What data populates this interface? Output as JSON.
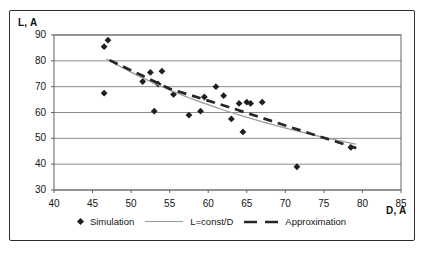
{
  "colors": {
    "background": "#ffffff",
    "frame_border": "#2e2e2e",
    "grid_line": "#8c8c8c",
    "axis_line": "#636363",
    "marker": "#1f1f1f",
    "const_line": "#9c9c9c",
    "approx_line": "#262626",
    "text": "#151515"
  },
  "axis_titles": {
    "y": "L, A",
    "x": "D, A"
  },
  "legend": {
    "items": [
      {
        "label": "Simulation",
        "marker": "diamond"
      },
      {
        "label": "L=const/D",
        "marker": "solid-line"
      },
      {
        "label": "Approximation",
        "marker": "dashed-line"
      }
    ]
  },
  "chart_data": {
    "type": "scatter",
    "title": "",
    "xlabel": "D, A",
    "ylabel": "L, A",
    "xlim": [
      40,
      85
    ],
    "ylim": [
      30,
      90
    ],
    "x_ticks": [
      40,
      45,
      50,
      55,
      60,
      65,
      70,
      75,
      80,
      85
    ],
    "y_ticks": [
      30,
      40,
      50,
      60,
      70,
      80,
      90
    ],
    "grid": "horizontal-only",
    "legend_position": "bottom",
    "series": [
      {
        "name": "Simulation",
        "type": "scatter",
        "marker": "diamond",
        "points": [
          [
            46.5,
            85.5
          ],
          [
            46.5,
            67.5
          ],
          [
            47,
            88
          ],
          [
            51.5,
            72
          ],
          [
            52.5,
            75.5
          ],
          [
            53,
            60.5
          ],
          [
            53.5,
            71
          ],
          [
            54,
            76
          ],
          [
            55.5,
            67
          ],
          [
            57.5,
            59
          ],
          [
            59,
            60.5
          ],
          [
            59.5,
            66
          ],
          [
            61,
            70
          ],
          [
            62,
            66.5
          ],
          [
            63,
            57.5
          ],
          [
            64,
            63.5
          ],
          [
            64.5,
            52.5
          ],
          [
            65,
            64
          ],
          [
            65.5,
            63.5
          ],
          [
            67,
            64
          ],
          [
            71.5,
            39
          ],
          [
            78.5,
            46.5
          ]
        ]
      },
      {
        "name": "L=const/D",
        "type": "curve",
        "style": "solid",
        "formula": "L = const / D",
        "const": 3780,
        "d_range": [
          46.8,
          79.4
        ]
      },
      {
        "name": "Approximation",
        "type": "line",
        "style": "dashed",
        "points": [
          [
            47.2,
            80.3
          ],
          [
            55,
            69.2
          ],
          [
            63,
            61.8
          ],
          [
            71,
            54
          ],
          [
            79.2,
            46.2
          ]
        ]
      }
    ]
  }
}
